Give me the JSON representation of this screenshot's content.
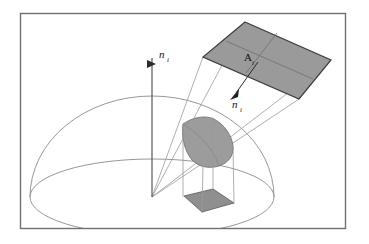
{
  "figure": {
    "kind": "solid-angle-diagram",
    "caption_text": "",
    "frame": {
      "x": 20,
      "y": 13,
      "width": 325,
      "height": 215,
      "stroke": "#6f6f74",
      "fill": "#ffffff"
    },
    "colors": {
      "background": "#ffffff",
      "frame_border": "#6f6f74",
      "line": "#8b8b90",
      "ray": "#9a9aa0",
      "patch_fill": "#9c9c9c",
      "patch_stroke": "#6a6a6a",
      "plane_fill": "#9a9a9a",
      "plane_stroke": "#3c3c3c",
      "base_fill": "#8f8f8f",
      "base_stroke": "#5a5a5a",
      "axis": "#4a4a4a",
      "text": "#111111"
    },
    "labels": [
      {
        "id": "normal-up",
        "base": "n",
        "subscript": "i",
        "x": 161,
        "y": 57,
        "description": "surface normal of the receiving point, vertical"
      },
      {
        "id": "area-patch",
        "base": "A",
        "subscript": "i",
        "x": 248,
        "y": 58,
        "description": "area of the emitting patch"
      },
      {
        "id": "normal-patch",
        "base": "n",
        "subscript": "i",
        "x": 237,
        "y": 106,
        "description": "surface normal of the emitting patch"
      }
    ],
    "geometry": {
      "origin": {
        "x": 152,
        "y": 197
      },
      "hemisphere": {
        "base_ellipse": {
          "cx": 152,
          "cy": 197,
          "rx": 122,
          "ry": 38
        },
        "dome_apex": {
          "x": 152,
          "y": 96
        }
      },
      "vertical_axis": {
        "x": 152,
        "y_top": 54,
        "y_bottom": 197
      },
      "emitting_plane_quad": [
        {
          "x": 245,
          "y": 22
        },
        {
          "x": 331,
          "y": 60
        },
        {
          "x": 299,
          "y": 99
        },
        {
          "x": 203,
          "y": 57
        }
      ],
      "plane_inner_edges": [
        [
          {
            "x": 225,
            "y": 41
          },
          {
            "x": 312,
            "y": 80
          }
        ],
        [
          {
            "x": 275,
            "y": 32
          },
          {
            "x": 245,
            "y": 73
          }
        ]
      ],
      "spherical_patch": [
        {
          "x": 184,
          "y": 125
        },
        {
          "x": 208,
          "y": 119
        },
        {
          "x": 230,
          "y": 136
        },
        {
          "x": 224,
          "y": 161
        },
        {
          "x": 206,
          "y": 166
        },
        {
          "x": 189,
          "y": 150
        }
      ],
      "projected_base_quad": [
        {
          "x": 184,
          "y": 196
        },
        {
          "x": 213,
          "y": 189
        },
        {
          "x": 234,
          "y": 203
        },
        {
          "x": 202,
          "y": 212
        }
      ],
      "cone_rays": [
        [
          {
            "x": 152,
            "y": 197
          },
          {
            "x": 245,
            "y": 22
          }
        ],
        [
          {
            "x": 152,
            "y": 197
          },
          {
            "x": 331,
            "y": 60
          }
        ],
        [
          {
            "x": 152,
            "y": 197
          },
          {
            "x": 299,
            "y": 99
          }
        ],
        [
          {
            "x": 152,
            "y": 197
          },
          {
            "x": 203,
            "y": 57
          }
        ]
      ],
      "prism_verticals": [
        [
          {
            "x": 184,
            "y": 125
          },
          {
            "x": 184,
            "y": 196
          }
        ],
        [
          {
            "x": 213,
            "y": 122
          },
          {
            "x": 213,
            "y": 189
          }
        ],
        [
          {
            "x": 234,
            "y": 140
          },
          {
            "x": 234,
            "y": 203
          }
        ],
        [
          {
            "x": 202,
            "y": 164
          },
          {
            "x": 202,
            "y": 212
          }
        ]
      ],
      "normal_arrow": {
        "from": {
          "x": 258,
          "y": 62
        },
        "to": {
          "x": 233,
          "y": 96
        }
      }
    }
  }
}
